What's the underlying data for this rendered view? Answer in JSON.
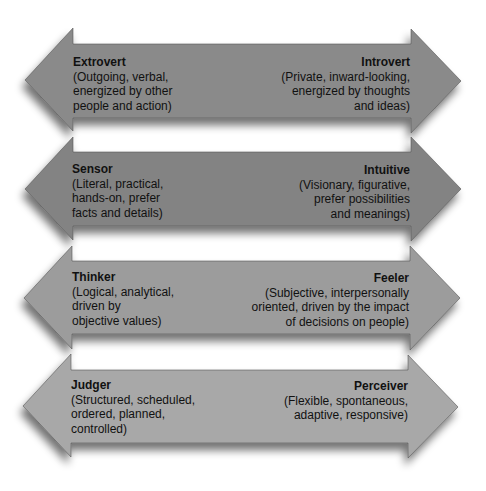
{
  "diagram": {
    "type": "bipolar-arrows",
    "arrows": [
      {
        "id": "ei",
        "color": "#8a8a8a",
        "left": {
          "title": "Extrovert",
          "desc": "(Outgoing, verbal,\nenergized by other\npeople and action)"
        },
        "right": {
          "title": "Introvert",
          "desc": "(Private, inward-looking,\nenergized by thoughts\nand ideas)"
        }
      },
      {
        "id": "sn",
        "color": "#838383",
        "left": {
          "title": "Sensor",
          "desc": "(Literal, practical,\nhands-on, prefer\nfacts and details)"
        },
        "right": {
          "title": "Intuitive",
          "desc": "(Visionary, figurative,\nprefer possibilities\nand meanings)"
        }
      },
      {
        "id": "tf",
        "color": "#9c9c9c",
        "left": {
          "title": "Thinker",
          "desc": "(Logical, analytical,\ndriven by\nobjective values)"
        },
        "right": {
          "title": "Feeler",
          "desc": "(Subjective, interpersonally\noriented, driven by the impact\nof decisions on people)"
        }
      },
      {
        "id": "jp",
        "color": "#a8a8a8",
        "left": {
          "title": "Judger",
          "desc": "(Structured, scheduled,\nordered, planned,\ncontrolled)"
        },
        "right": {
          "title": "Perceiver",
          "desc": "(Flexible, spontaneous,\nadaptive, responsive)"
        }
      }
    ]
  }
}
